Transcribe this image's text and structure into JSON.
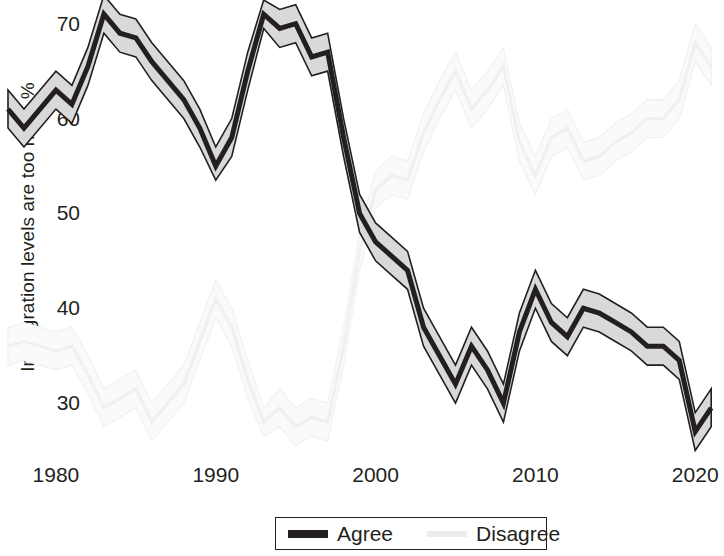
{
  "chart_data": {
    "type": "line",
    "title": "",
    "xlabel": "",
    "ylabel": "Immigration levels are too high, %",
    "xlim": [
      1976.5,
      2021.8
    ],
    "ylim": [
      24.0,
      72.5
    ],
    "ytick_values": [
      70,
      60,
      50,
      40,
      30
    ],
    "ytick_labels": [
      "70",
      "60",
      "50",
      "40",
      "30"
    ],
    "xtick_values": [
      1980,
      1990,
      2000,
      2010,
      2020
    ],
    "xtick_labels": [
      "1980",
      "1990",
      "2000",
      "2010",
      "2020"
    ],
    "grid": false,
    "legend_position": "bottom-center",
    "band_description": "shaded confidence interval around each line",
    "colors": {
      "agree_line": "#231f20",
      "agree_band": "#d9d9d9",
      "disagree_line": "#f0f0f0",
      "disagree_band": "#fafafa",
      "background": "#ffffff",
      "text": "#231f20"
    },
    "series": [
      {
        "name": "Agree",
        "x": [
          1977,
          1978,
          1980,
          1981,
          1982,
          1983,
          1984,
          1985,
          1986,
          1988,
          1989,
          1990,
          1991,
          1992,
          1993,
          1994,
          1995,
          1996,
          1997,
          1998,
          1999,
          2000,
          2001,
          2002,
          2003,
          2004,
          2005,
          2006,
          2007,
          2008,
          2009,
          2010,
          2011,
          2012,
          2013,
          2014,
          2015,
          2016,
          2017,
          2018,
          2019,
          2020,
          2021
        ],
        "values": [
          61.0,
          59.0,
          63.0,
          61.5,
          65.5,
          71.0,
          69.0,
          68.5,
          66.0,
          62.0,
          59.0,
          55.0,
          58.0,
          65.0,
          71.0,
          69.5,
          70.0,
          66.5,
          67.0,
          58.0,
          50.0,
          47.0,
          45.5,
          44.0,
          38.0,
          35.0,
          32.0,
          36.0,
          33.5,
          30.0,
          37.5,
          42.0,
          38.5,
          37.0,
          40.0,
          39.5,
          38.5,
          37.5,
          36.0,
          36.0,
          34.5,
          27.0,
          29.5
        ],
        "ci_lower": [
          59.0,
          57.0,
          61.0,
          59.5,
          63.5,
          69.0,
          67.0,
          66.5,
          64.0,
          60.0,
          57.0,
          53.5,
          56.0,
          63.0,
          69.5,
          67.5,
          68.0,
          64.5,
          65.0,
          56.0,
          48.0,
          45.0,
          43.5,
          42.0,
          36.0,
          33.0,
          30.0,
          34.0,
          31.5,
          28.0,
          35.5,
          40.0,
          36.5,
          35.0,
          38.0,
          37.5,
          36.5,
          35.5,
          34.0,
          34.0,
          32.5,
          25.0,
          27.5
        ],
        "ci_upper": [
          63.0,
          61.0,
          65.0,
          63.5,
          67.5,
          73.0,
          71.0,
          70.5,
          68.0,
          64.0,
          61.0,
          57.0,
          60.0,
          67.0,
          72.5,
          71.5,
          72.0,
          68.5,
          69.0,
          60.0,
          52.0,
          49.0,
          47.5,
          46.0,
          40.0,
          37.0,
          34.0,
          38.0,
          35.5,
          32.0,
          39.5,
          44.0,
          40.5,
          39.0,
          42.0,
          41.5,
          40.5,
          39.5,
          38.0,
          38.0,
          36.5,
          29.0,
          31.5
        ]
      },
      {
        "name": "Disagree",
        "x": [
          1977,
          1978,
          1980,
          1981,
          1982,
          1983,
          1984,
          1985,
          1986,
          1988,
          1989,
          1990,
          1991,
          1992,
          1993,
          1994,
          1995,
          1996,
          1997,
          1998,
          1999,
          2000,
          2001,
          2002,
          2003,
          2004,
          2005,
          2006,
          2007,
          2008,
          2009,
          2010,
          2011,
          2012,
          2013,
          2014,
          2015,
          2016,
          2017,
          2018,
          2019,
          2020,
          2021
        ],
        "values": [
          36.0,
          36.5,
          35.5,
          36.0,
          33.0,
          29.5,
          30.5,
          31.5,
          28.0,
          32.0,
          36.5,
          41.0,
          38.0,
          32.5,
          28.0,
          29.5,
          27.5,
          28.5,
          28.0,
          36.0,
          46.0,
          52.5,
          54.0,
          53.5,
          58.5,
          62.0,
          65.0,
          61.0,
          63.0,
          65.5,
          57.5,
          54.0,
          58.0,
          59.0,
          55.5,
          56.0,
          57.5,
          58.5,
          60.0,
          60.0,
          62.0,
          68.0,
          65.5
        ],
        "ci_lower": [
          34.0,
          34.5,
          33.5,
          34.0,
          31.0,
          27.5,
          28.5,
          29.5,
          26.0,
          30.0,
          34.5,
          39.0,
          36.0,
          30.5,
          26.5,
          27.5,
          25.5,
          26.5,
          26.0,
          34.0,
          44.0,
          50.5,
          52.0,
          51.5,
          56.5,
          60.0,
          63.0,
          59.0,
          61.0,
          63.5,
          55.5,
          52.0,
          56.0,
          57.0,
          53.5,
          54.0,
          55.5,
          56.5,
          58.0,
          58.0,
          60.0,
          66.0,
          63.5
        ],
        "ci_upper": [
          38.0,
          38.5,
          37.5,
          38.0,
          35.0,
          31.5,
          32.5,
          33.5,
          30.0,
          34.0,
          38.5,
          43.0,
          40.0,
          34.5,
          29.5,
          31.5,
          29.5,
          30.5,
          30.0,
          38.0,
          48.0,
          54.5,
          56.0,
          55.5,
          60.5,
          64.0,
          67.0,
          63.0,
          65.0,
          67.5,
          59.5,
          56.0,
          60.0,
          61.0,
          57.5,
          58.0,
          59.5,
          60.5,
          62.0,
          62.0,
          64.0,
          70.0,
          67.5
        ]
      }
    ]
  },
  "axis": {
    "y_title": "Immigration levels are too high, %"
  },
  "legend": {
    "entries": [
      {
        "label": "Agree",
        "swatch": "agree"
      },
      {
        "label": "Disagree",
        "swatch": "disagree"
      }
    ]
  }
}
